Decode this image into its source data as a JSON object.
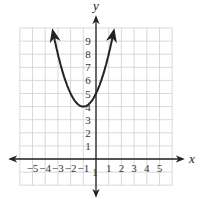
{
  "chart_data": {
    "type": "line",
    "title": "",
    "xlabel": "x",
    "ylabel": "y",
    "xlim": [
      -6,
      6
    ],
    "ylim": [
      -2,
      10
    ],
    "grid": true,
    "x_ticks": [
      "-5",
      "-4",
      "-3",
      "-2",
      "-1",
      "1",
      "2",
      "3",
      "4",
      "5"
    ],
    "y_ticks": [
      "-1",
      "1",
      "2",
      "3",
      "4",
      "5",
      "6",
      "7",
      "8",
      "9"
    ],
    "series": [
      {
        "name": "y = (x + 1)^2 + 4",
        "vertex": [
          -1,
          4
        ],
        "y_intercept": 5,
        "x": [
          -3.4,
          -3,
          -2.5,
          -2,
          -1.5,
          -1,
          -0.5,
          0,
          0.5,
          1,
          1.4
        ],
        "y": [
          9.76,
          8,
          6.25,
          5,
          4.25,
          4,
          4.25,
          5,
          6.25,
          8,
          9.76
        ],
        "arrows_on_ends": true
      }
    ],
    "colors": {
      "curve": "#222222",
      "grid": "#cfcfcf",
      "axes": "#222222"
    }
  }
}
